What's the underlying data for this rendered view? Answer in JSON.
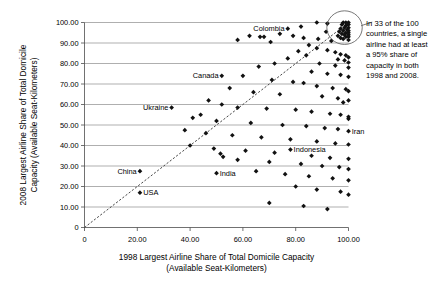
{
  "chart_data": {
    "type": "scatter",
    "title": "",
    "xlabel": "1998 Largest Airline Share of Total Domicile Capacity (Available Seat-Kilometers)",
    "xlabel_line1": "1998 Largest Airline Share of Total Domicile Capacity",
    "xlabel_line2": "(Available Seat-Kilometers)",
    "ylabel": "2008 Largest Airline Share of Total Domicile Capacity (Available Seat-Kilometers)",
    "ylabel_line1": "2008 Largest Airline Share of Total Domicile",
    "ylabel_line2": "Capacity (Available Seat-Kilometers)",
    "xlim": [
      0,
      100
    ],
    "ylim": [
      0,
      100
    ],
    "xticks": [
      0,
      20,
      40,
      60,
      80,
      100
    ],
    "xtick_labels": [
      "0",
      "20.00",
      "40.00",
      "60.00",
      "80.00",
      "100.00"
    ],
    "yticks": [
      0,
      10,
      20,
      30,
      40,
      50,
      60,
      70,
      80,
      90,
      100
    ],
    "ytick_labels": [
      "0",
      "10.00",
      "20.00",
      "30.00",
      "40.00",
      "50.00",
      "60.00",
      "70.00",
      "80.00",
      "90.00",
      "100.00"
    ],
    "grid": "horizontal",
    "legend": "none",
    "marker": "diamond",
    "marker_color": "#111111",
    "reference_line": {
      "type": "dashed-diagonal",
      "from": [
        0,
        0
      ],
      "to": [
        100,
        100
      ],
      "label": "y = x"
    },
    "annotation": {
      "text": "In 33 of the 100 countries, a single airline had at least a 95% share of capacity in both 1998 and 2008.",
      "lines": [
        "In 33 of the 100",
        "countries, a single",
        "airline had at least",
        "a 95% share of",
        "capacity in both",
        "1998 and 2008."
      ],
      "highlight_region": {
        "cx": 98.5,
        "cy": 97.5,
        "rx": 5.0,
        "ry": 6.0
      }
    },
    "labeled_points": [
      {
        "name": "Colombia",
        "x": 77.0,
        "y": 97.0,
        "label_side": "left"
      },
      {
        "name": "Canada",
        "x": 52.0,
        "y": 74.0,
        "label_side": "left"
      },
      {
        "name": "Ukraine",
        "x": 33.0,
        "y": 58.5,
        "label_side": "left"
      },
      {
        "name": "China",
        "x": 21.0,
        "y": 27.5,
        "label_side": "left"
      },
      {
        "name": "USA",
        "x": 21.0,
        "y": 17.0,
        "label_side": "right"
      },
      {
        "name": "India",
        "x": 50.0,
        "y": 26.5,
        "label_side": "right"
      },
      {
        "name": "Indonesia",
        "x": 78.0,
        "y": 38.0,
        "label_side": "right"
      },
      {
        "name": "Iran",
        "x": 100.0,
        "y": 47.0,
        "label_side": "right"
      }
    ],
    "points": [
      [
        77.0,
        97.0
      ],
      [
        52.0,
        74.0
      ],
      [
        33.0,
        58.5
      ],
      [
        21.0,
        27.5
      ],
      [
        21.0,
        17.0
      ],
      [
        50.0,
        26.5
      ],
      [
        78.0,
        38.0
      ],
      [
        100.0,
        47.0
      ],
      [
        98.0,
        100.0
      ],
      [
        99.0,
        100.0
      ],
      [
        100.0,
        100.0
      ],
      [
        97.5,
        99.0
      ],
      [
        99.0,
        98.5
      ],
      [
        100.0,
        99.0
      ],
      [
        98.5,
        97.5
      ],
      [
        100.0,
        97.5
      ],
      [
        97.0,
        97.0
      ],
      [
        99.5,
        96.5
      ],
      [
        98.0,
        96.0
      ],
      [
        100.0,
        96.0
      ],
      [
        96.5,
        95.5
      ],
      [
        99.0,
        95.0
      ],
      [
        100.0,
        95.0
      ],
      [
        97.5,
        94.5
      ],
      [
        98.5,
        94.0
      ],
      [
        100.0,
        94.0
      ],
      [
        96.0,
        93.5
      ],
      [
        99.0,
        93.0
      ],
      [
        100.0,
        93.0
      ],
      [
        97.0,
        92.5
      ],
      [
        98.0,
        92.0
      ],
      [
        100.0,
        91.5
      ],
      [
        88.0,
        100.0
      ],
      [
        92.0,
        99.5
      ],
      [
        82.0,
        98.0
      ],
      [
        62.5,
        93.5
      ],
      [
        66.5,
        93.0
      ],
      [
        68.0,
        93.0
      ],
      [
        74.0,
        94.5
      ],
      [
        79.0,
        93.5
      ],
      [
        83.0,
        92.5
      ],
      [
        88.5,
        92.0
      ],
      [
        91.5,
        95.5
      ],
      [
        93.5,
        91.0
      ],
      [
        58.0,
        91.5
      ],
      [
        70.5,
        90.5
      ],
      [
        85.0,
        89.0
      ],
      [
        88.0,
        87.5
      ],
      [
        92.0,
        86.5
      ],
      [
        95.0,
        85.5
      ],
      [
        97.0,
        84.5
      ],
      [
        99.0,
        84.0
      ],
      [
        100.0,
        83.0
      ],
      [
        96.0,
        82.0
      ],
      [
        98.5,
        81.5
      ],
      [
        100.0,
        80.5
      ],
      [
        81.0,
        86.0
      ],
      [
        84.0,
        84.0
      ],
      [
        77.0,
        82.5
      ],
      [
        89.0,
        80.0
      ],
      [
        72.0,
        80.0
      ],
      [
        95.0,
        79.0
      ],
      [
        100.0,
        78.0
      ],
      [
        66.0,
        78.5
      ],
      [
        86.0,
        76.0
      ],
      [
        92.0,
        75.0
      ],
      [
        97.0,
        74.5
      ],
      [
        100.0,
        73.5
      ],
      [
        60.0,
        74.0
      ],
      [
        71.0,
        72.0
      ],
      [
        79.0,
        71.0
      ],
      [
        83.0,
        70.5
      ],
      [
        88.0,
        69.0
      ],
      [
        94.0,
        68.0
      ],
      [
        99.0,
        67.5
      ],
      [
        100.0,
        66.5
      ],
      [
        55.0,
        68.0
      ],
      [
        64.0,
        66.0
      ],
      [
        74.0,
        65.0
      ],
      [
        90.0,
        64.0
      ],
      [
        96.0,
        63.0
      ],
      [
        100.0,
        62.0
      ],
      [
        98.0,
        61.0
      ],
      [
        47.0,
        62.0
      ],
      [
        52.0,
        60.0
      ],
      [
        58.0,
        58.5
      ],
      [
        69.0,
        58.0
      ],
      [
        80.0,
        57.5
      ],
      [
        86.0,
        56.5
      ],
      [
        93.0,
        55.5
      ],
      [
        97.0,
        55.0
      ],
      [
        100.0,
        54.0
      ],
      [
        41.0,
        53.5
      ],
      [
        44.0,
        55.0
      ],
      [
        50.0,
        52.0
      ],
      [
        63.0,
        51.0
      ],
      [
        75.0,
        50.0
      ],
      [
        84.0,
        49.5
      ],
      [
        91.0,
        48.5
      ],
      [
        96.0,
        48.0
      ],
      [
        100.0,
        53.0
      ],
      [
        38.0,
        47.5
      ],
      [
        46.0,
        46.0
      ],
      [
        56.0,
        45.0
      ],
      [
        67.0,
        44.0
      ],
      [
        78.0,
        43.0
      ],
      [
        88.0,
        42.0
      ],
      [
        95.0,
        41.0
      ],
      [
        100.0,
        40.5
      ],
      [
        40.0,
        40.0
      ],
      [
        49.0,
        38.5
      ],
      [
        61.0,
        37.5
      ],
      [
        72.0,
        36.5
      ],
      [
        86.0,
        35.0
      ],
      [
        93.0,
        34.0
      ],
      [
        100.0,
        33.5
      ],
      [
        51.5,
        36.0
      ],
      [
        52.5,
        34.5
      ],
      [
        58.0,
        33.0
      ],
      [
        70.0,
        32.0
      ],
      [
        82.0,
        31.0
      ],
      [
        90.0,
        30.0
      ],
      [
        96.5,
        29.5
      ],
      [
        100.0,
        28.5
      ],
      [
        65.0,
        27.5
      ],
      [
        76.0,
        26.0
      ],
      [
        85.0,
        25.0
      ],
      [
        94.0,
        24.0
      ],
      [
        100.0,
        23.0
      ],
      [
        80.0,
        20.0
      ],
      [
        88.0,
        18.5
      ],
      [
        97.0,
        17.5
      ],
      [
        100.0,
        16.0
      ],
      [
        70.0,
        12.0
      ],
      [
        83.0,
        10.5
      ],
      [
        92.0,
        9.0
      ]
    ]
  }
}
